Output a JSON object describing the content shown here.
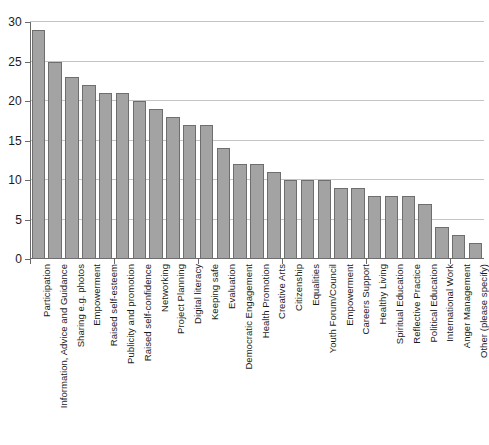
{
  "chart_data": {
    "type": "bar",
    "title": "",
    "subtitle": "",
    "xlabel": "",
    "ylabel": "",
    "ylim": [
      0,
      30
    ],
    "yticks": [
      0,
      5,
      10,
      15,
      20,
      25,
      30
    ],
    "ytick_labels": [
      "0",
      "5",
      "10",
      "15",
      "20",
      "25",
      "30"
    ],
    "grid": true,
    "legend": false,
    "bar_color": "#a3a3a3",
    "bar_edge_color": "#6e6e6e",
    "axis_color": "#6a6a6a",
    "gridline_color": "#c4c4c4",
    "background_color": "#ffffff",
    "categories": [
      "Participation",
      "Information, Advice and Guidance",
      "Sharing e.g. photos",
      "Empowerment",
      "Raised self-esteem",
      "Publicity and promotion",
      "Raised self-confidence",
      "Networking",
      "Project Planning",
      "Digital literacy",
      "Keeping safe",
      "Evaluation",
      "Democratic Engagement",
      "Health Promotion",
      "Creative Arts",
      "Citizenship",
      "Equalities",
      "Youth Forum/Council",
      "Empowerment",
      "Careers Support",
      "Healthy Living",
      "Spiritual Education",
      "Reflective Practice",
      "Political Education",
      "International Work",
      "Anger Management",
      "Other (please specify)"
    ],
    "values": [
      29,
      25,
      23,
      22,
      21,
      21,
      20,
      19,
      18,
      17,
      17,
      14,
      12,
      12,
      11,
      10,
      10,
      10,
      9,
      9,
      8,
      8,
      8,
      7,
      4,
      3,
      2
    ]
  }
}
